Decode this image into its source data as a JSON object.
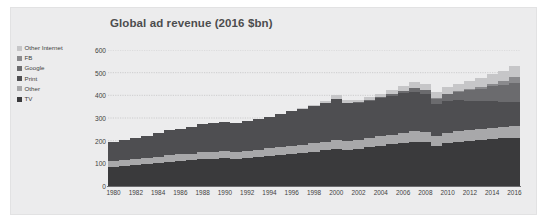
{
  "chart_data": {
    "type": "area",
    "title": "Global ad revenue (2016 $bn)",
    "xlabel": "",
    "ylabel": "",
    "ylim": [
      0,
      600
    ],
    "yticks": [
      0,
      100,
      200,
      300,
      400,
      500,
      600
    ],
    "grid": true,
    "stacked": true,
    "legend_position": "left",
    "x": [
      1980,
      1981,
      1982,
      1983,
      1984,
      1985,
      1986,
      1987,
      1988,
      1989,
      1990,
      1991,
      1992,
      1993,
      1994,
      1995,
      1996,
      1997,
      1998,
      1999,
      2000,
      2001,
      2002,
      2003,
      2004,
      2005,
      2006,
      2007,
      2008,
      2009,
      2010,
      2011,
      2012,
      2013,
      2014,
      2015,
      2016
    ],
    "xtick_labels": [
      "1980",
      "1982",
      "1984",
      "1986",
      "1988",
      "1990",
      "1992",
      "1994",
      "1996",
      "1998",
      "2000",
      "2002",
      "2004",
      "2006",
      "2008",
      "2010",
      "2012",
      "2014",
      "2016"
    ],
    "series": [
      {
        "name": "TV",
        "color": "#3a3a3c",
        "values": [
          85,
          88,
          92,
          97,
          102,
          107,
          110,
          114,
          118,
          120,
          122,
          121,
          124,
          128,
          133,
          138,
          142,
          147,
          152,
          158,
          165,
          160,
          163,
          170,
          178,
          184,
          190,
          196,
          192,
          178,
          190,
          196,
          200,
          203,
          207,
          210,
          212
        ]
      },
      {
        "name": "Other",
        "color": "#a8a8aa",
        "values": [
          26,
          26,
          27,
          27,
          28,
          28,
          29,
          29,
          30,
          30,
          31,
          31,
          32,
          32,
          33,
          34,
          35,
          36,
          37,
          38,
          40,
          39,
          39,
          40,
          42,
          43,
          45,
          46,
          46,
          43,
          45,
          46,
          47,
          48,
          49,
          50,
          51
        ]
      },
      {
        "name": "Print",
        "color": "#4e4e51",
        "values": [
          85,
          88,
          92,
          98,
          104,
          110,
          114,
          119,
          124,
          127,
          129,
          126,
          129,
          134,
          140,
          146,
          152,
          158,
          164,
          171,
          178,
          168,
          166,
          167,
          170,
          172,
          174,
          174,
          166,
          142,
          140,
          136,
          130,
          124,
          118,
          112,
          106
        ]
      },
      {
        "name": "Google",
        "color": "#6b6b6e",
        "values": [
          0,
          0,
          0,
          0,
          0,
          0,
          0,
          0,
          0,
          0,
          0,
          0,
          0,
          0,
          0,
          0,
          0,
          0,
          0,
          0,
          0,
          0,
          1,
          2,
          3,
          6,
          10,
          16,
          21,
          23,
          29,
          37,
          46,
          55,
          65,
          75,
          86
        ]
      },
      {
        "name": "FB",
        "color": "#8a8a8d",
        "values": [
          0,
          0,
          0,
          0,
          0,
          0,
          0,
          0,
          0,
          0,
          0,
          0,
          0,
          0,
          0,
          0,
          0,
          0,
          0,
          0,
          0,
          0,
          0,
          0,
          0,
          0,
          0,
          0,
          0,
          1,
          2,
          3,
          5,
          7,
          12,
          18,
          27
        ]
      },
      {
        "name": "Other Internet",
        "color": "#c6c6c8",
        "values": [
          0,
          0,
          0,
          0,
          0,
          0,
          0,
          0,
          0,
          0,
          0,
          0,
          0,
          0,
          0,
          0,
          0,
          1,
          3,
          8,
          18,
          13,
          12,
          13,
          15,
          18,
          22,
          26,
          27,
          26,
          30,
          33,
          36,
          38,
          41,
          44,
          47
        ]
      }
    ]
  },
  "legend": {
    "items": [
      {
        "label": "Other Internet",
        "color": "#c6c6c8"
      },
      {
        "label": "FB",
        "color": "#8a8a8d"
      },
      {
        "label": "Google",
        "color": "#6b6b6e"
      },
      {
        "label": "Print",
        "color": "#4e4e51"
      },
      {
        "label": "Other",
        "color": "#a8a8aa"
      },
      {
        "label": "TV",
        "color": "#3a3a3c"
      }
    ]
  },
  "colors": {
    "panel_background": "#ececed",
    "page_background": "#ffffff",
    "axis": "#6d6d70",
    "gridline": "#c9c9cb",
    "text": "#3f3f41",
    "title_text": "#4c4c4e"
  }
}
